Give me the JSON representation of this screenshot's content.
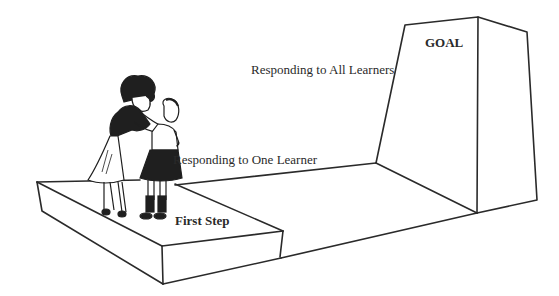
{
  "diagram": {
    "labels": {
      "goal": "GOAL",
      "all_learners": "Responding to All Learners",
      "one_learner": "Responding to One Learner",
      "first_step": "First Step"
    },
    "figures": {
      "teacher": "adult-woman-figure",
      "student": "child-figure"
    },
    "colors": {
      "line": "#2a2a2a",
      "background": "#ffffff"
    }
  }
}
